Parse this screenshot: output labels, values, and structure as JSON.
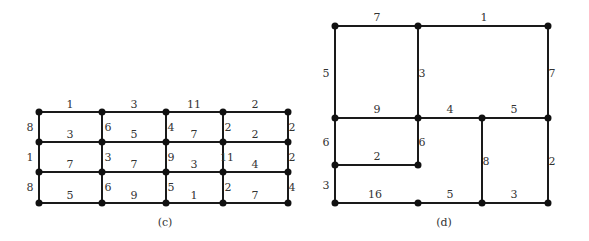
{
  "colors": {
    "edge": "#1a1a1a",
    "node": "#111111",
    "text": "#333333",
    "background": "#ffffff"
  },
  "graphs": [
    {
      "caption": "(c)",
      "caption_pos": [
        165,
        226
      ],
      "nodes": [
        [
          39,
          112
        ],
        [
          102,
          112
        ],
        [
          166,
          112
        ],
        [
          223,
          112
        ],
        [
          288,
          112
        ],
        [
          39,
          142
        ],
        [
          102,
          142
        ],
        [
          166,
          142
        ],
        [
          223,
          142
        ],
        [
          288,
          142
        ],
        [
          39,
          172
        ],
        [
          102,
          172
        ],
        [
          166,
          172
        ],
        [
          223,
          172
        ],
        [
          288,
          172
        ],
        [
          39,
          203
        ],
        [
          102,
          203
        ],
        [
          166,
          203
        ],
        [
          223,
          203
        ],
        [
          288,
          203
        ]
      ],
      "edges": [
        {
          "a": 0,
          "b": 1,
          "w": "1",
          "lx": 70,
          "ly": 108
        },
        {
          "a": 1,
          "b": 2,
          "w": "3",
          "lx": 134,
          "ly": 108
        },
        {
          "a": 2,
          "b": 3,
          "w": "11",
          "lx": 194,
          "ly": 108
        },
        {
          "a": 3,
          "b": 4,
          "w": "2",
          "lx": 255,
          "ly": 108
        },
        {
          "a": 5,
          "b": 6,
          "w": "3",
          "lx": 70,
          "ly": 138
        },
        {
          "a": 6,
          "b": 7,
          "w": "5",
          "lx": 134,
          "ly": 138
        },
        {
          "a": 7,
          "b": 8,
          "w": "7",
          "lx": 194,
          "ly": 138
        },
        {
          "a": 8,
          "b": 9,
          "w": "2",
          "lx": 255,
          "ly": 138
        },
        {
          "a": 10,
          "b": 11,
          "w": "7",
          "lx": 70,
          "ly": 168
        },
        {
          "a": 11,
          "b": 12,
          "w": "7",
          "lx": 134,
          "ly": 168
        },
        {
          "a": 12,
          "b": 13,
          "w": "3",
          "lx": 194,
          "ly": 168
        },
        {
          "a": 13,
          "b": 14,
          "w": "4",
          "lx": 255,
          "ly": 168
        },
        {
          "a": 15,
          "b": 16,
          "w": "5",
          "lx": 70,
          "ly": 199
        },
        {
          "a": 16,
          "b": 17,
          "w": "9",
          "lx": 134,
          "ly": 199
        },
        {
          "a": 17,
          "b": 18,
          "w": "1",
          "lx": 194,
          "ly": 199
        },
        {
          "a": 18,
          "b": 19,
          "w": "7",
          "lx": 255,
          "ly": 199
        },
        {
          "a": 0,
          "b": 5,
          "w": "8",
          "lx": 30,
          "ly": 131
        },
        {
          "a": 1,
          "b": 6,
          "w": "6",
          "lx": 108,
          "ly": 131
        },
        {
          "a": 2,
          "b": 7,
          "w": "4",
          "lx": 171,
          "ly": 131
        },
        {
          "a": 3,
          "b": 8,
          "w": "2",
          "lx": 228,
          "ly": 131
        },
        {
          "a": 4,
          "b": 9,
          "w": "2",
          "lx": 292,
          "ly": 131
        },
        {
          "a": 5,
          "b": 10,
          "w": "1",
          "lx": 30,
          "ly": 161
        },
        {
          "a": 6,
          "b": 11,
          "w": "3",
          "lx": 108,
          "ly": 161
        },
        {
          "a": 7,
          "b": 12,
          "w": "9",
          "lx": 171,
          "ly": 161
        },
        {
          "a": 8,
          "b": 13,
          "w": "11",
          "lx": 227,
          "ly": 161
        },
        {
          "a": 9,
          "b": 14,
          "w": "2",
          "lx": 292,
          "ly": 161
        },
        {
          "a": 10,
          "b": 15,
          "w": "8",
          "lx": 30,
          "ly": 191
        },
        {
          "a": 11,
          "b": 16,
          "w": "6",
          "lx": 108,
          "ly": 191
        },
        {
          "a": 12,
          "b": 17,
          "w": "5",
          "lx": 171,
          "ly": 191
        },
        {
          "a": 13,
          "b": 18,
          "w": "2",
          "lx": 228,
          "ly": 191
        },
        {
          "a": 14,
          "b": 19,
          "w": "4",
          "lx": 292,
          "ly": 191
        }
      ]
    },
    {
      "caption": "(d)",
      "caption_pos": [
        444,
        226
      ],
      "nodes": [
        [
          335,
          26
        ],
        [
          418,
          26
        ],
        [
          548,
          26
        ],
        [
          335,
          118
        ],
        [
          418,
          118
        ],
        [
          482,
          118
        ],
        [
          548,
          118
        ],
        [
          335,
          165
        ],
        [
          418,
          165
        ],
        [
          335,
          203
        ],
        [
          418,
          203
        ],
        [
          482,
          203
        ],
        [
          548,
          203
        ]
      ],
      "edges": [
        {
          "a": 0,
          "b": 1,
          "w": "7",
          "lx": 377,
          "ly": 21
        },
        {
          "a": 1,
          "b": 2,
          "w": "1",
          "lx": 484,
          "ly": 21
        },
        {
          "a": 0,
          "b": 3,
          "w": "5",
          "lx": 326,
          "ly": 77
        },
        {
          "a": 1,
          "b": 4,
          "w": "3",
          "lx": 422,
          "ly": 77
        },
        {
          "a": 2,
          "b": 6,
          "w": "7",
          "lx": 552,
          "ly": 77
        },
        {
          "a": 3,
          "b": 4,
          "w": "9",
          "lx": 377,
          "ly": 113
        },
        {
          "a": 4,
          "b": 5,
          "w": "4",
          "lx": 450,
          "ly": 113
        },
        {
          "a": 5,
          "b": 6,
          "w": "5",
          "lx": 514,
          "ly": 113
        },
        {
          "a": 3,
          "b": 7,
          "w": "6",
          "lx": 326,
          "ly": 146
        },
        {
          "a": 4,
          "b": 8,
          "w": "6",
          "lx": 422,
          "ly": 146
        },
        {
          "a": 7,
          "b": 8,
          "w": "2",
          "lx": 377,
          "ly": 160
        },
        {
          "a": 5,
          "b": 11,
          "w": "8",
          "lx": 486,
          "ly": 165
        },
        {
          "a": 6,
          "b": 12,
          "w": "2",
          "lx": 552,
          "ly": 165
        },
        {
          "a": 7,
          "b": 9,
          "w": "3",
          "lx": 326,
          "ly": 189
        },
        {
          "a": 9,
          "b": 10,
          "w": "16",
          "lx": 375,
          "ly": 198
        },
        {
          "a": 10,
          "b": 11,
          "w": "5",
          "lx": 450,
          "ly": 198
        },
        {
          "a": 11,
          "b": 12,
          "w": "3",
          "lx": 514,
          "ly": 198
        }
      ]
    }
  ]
}
